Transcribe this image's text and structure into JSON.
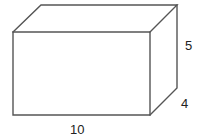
{
  "figure": {
    "type": "rectangular-prism",
    "dimensions": {
      "length": "10",
      "height": "5",
      "depth": "4"
    },
    "colors": {
      "edge": "#555555",
      "label": "#222222",
      "background": "#ffffff"
    }
  }
}
